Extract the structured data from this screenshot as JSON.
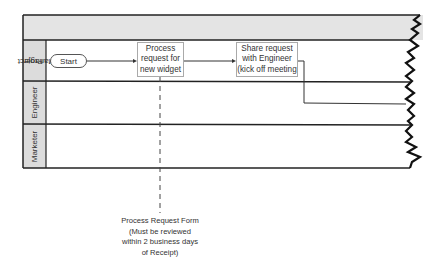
{
  "diagram": {
    "title": "Widget Creation",
    "type": "swimlane-flowchart",
    "lanes": [
      {
        "label_line1": "Project",
        "label_line2": "Manager"
      },
      {
        "label_line1": "Engineer",
        "label_line2": ""
      },
      {
        "label_line1": "Marketer",
        "label_line2": ""
      }
    ],
    "nodes": {
      "start": {
        "label": "Start",
        "shape": "terminator",
        "lane": 0
      },
      "process": {
        "label_lines": [
          "Process",
          "request for",
          "new widget"
        ],
        "shape": "process",
        "lane": 0
      },
      "share": {
        "label_lines": [
          "Share request",
          "with Engineer",
          "(kick off meeting"
        ],
        "shape": "process",
        "lane": 0
      }
    },
    "annotation": {
      "lines": [
        "Process Request Form",
        "(Must be reviewed",
        "within 2 business days",
        "of Receipt)"
      ],
      "attached_to": "process"
    },
    "colors": {
      "title_bg": "#e4e4e4",
      "lane_label_bg": "#dcdcdc",
      "frame": "#222222",
      "box_border": "#aaaaaa"
    }
  }
}
